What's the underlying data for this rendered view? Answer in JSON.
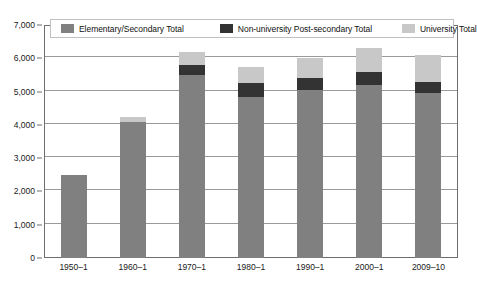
{
  "chart_data": {
    "type": "bar",
    "subtype": "stacked",
    "title": "",
    "subtitle": "",
    "xlabel": "",
    "ylabel": "",
    "categories": [
      "1950–1",
      "1960–1",
      "1970–1",
      "1980–1",
      "1990–1",
      "2000–1",
      "2009–10"
    ],
    "series": [
      {
        "name": "Elementary/Secondary Total",
        "color": "#808080",
        "values": [
          2500,
          4100,
          5500,
          4850,
          5050,
          5200,
          4950
        ]
      },
      {
        "name": "Non-university Post-secondary Total",
        "color": "#333333",
        "values": [
          0,
          0,
          300,
          400,
          350,
          400,
          350
        ]
      },
      {
        "name": "University Total",
        "color": "#c8c8c8",
        "values": [
          0,
          150,
          400,
          500,
          600,
          700,
          800
        ]
      }
    ],
    "totals": [
      2500,
      4250,
      6200,
      5750,
      6000,
      6300,
      6100
    ],
    "ylim": [
      0,
      7000
    ],
    "ytick_values": [
      0,
      1000,
      2000,
      3000,
      4000,
      5000,
      6000,
      7000
    ],
    "ytick_labels": [
      "0",
      "1,000",
      "2,000",
      "3,000",
      "4,000",
      "5,000",
      "6,000",
      "7,000"
    ],
    "grid": true,
    "grid_axis": "y",
    "legend_position": "top-inside"
  },
  "legend": {
    "items": [
      {
        "label": "Elementary/Secondary Total",
        "color": "#808080",
        "icon": "legend-swatch-icon"
      },
      {
        "label": "Non-university Post-secondary Total",
        "color": "#333333",
        "icon": "legend-swatch-icon"
      },
      {
        "label": "University Total",
        "color": "#c8c8c8",
        "icon": "legend-swatch-icon"
      }
    ]
  },
  "colors": {
    "elementary_secondary": "#808080",
    "non_university": "#333333",
    "university": "#c8c8c8",
    "gridline": "#9a9a9a",
    "frame": "#6e6e6e",
    "text": "#1a1a1a",
    "background": "#ffffff"
  },
  "axis": {
    "y_labels": [
      "7,000",
      "6,000",
      "5,000",
      "4,000",
      "3,000",
      "2,000",
      "1,000",
      "0"
    ],
    "x_labels": [
      "1950–1",
      "1960–1",
      "1970–1",
      "1980–1",
      "1990–1",
      "2000–1",
      "2009–10"
    ]
  }
}
